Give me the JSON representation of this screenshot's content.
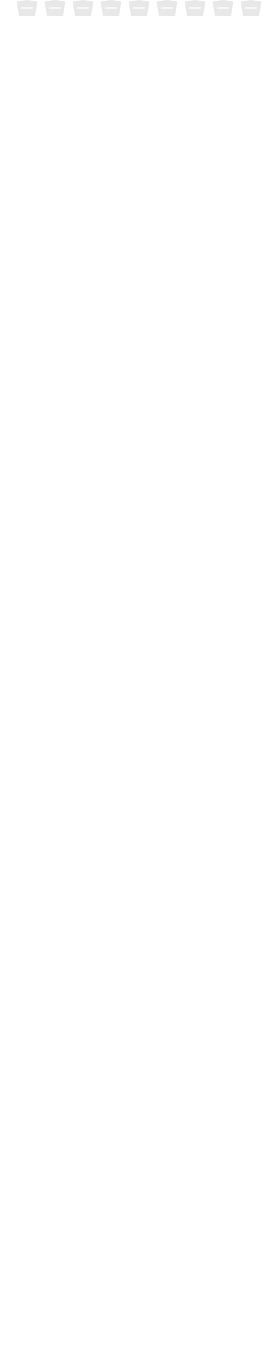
{
  "document": {
    "title": "Report Page Preview",
    "appearance": "faded-grayscale-scan",
    "page_width_px": 278,
    "page_height_px": 1347,
    "ink_color": "#e3e3e3",
    "background_color": "#ffffff",
    "rule_color": "#ededed"
  },
  "sections": [
    {
      "type": "icon-row",
      "label": "icon row (clipped)"
    },
    {
      "type": "text-block",
      "label": "paragraph block"
    },
    {
      "type": "wheel",
      "label": "radial wheel diagram"
    },
    {
      "type": "bars",
      "label": "chevron bar groups"
    },
    {
      "type": "icon-row",
      "label": "icon row"
    },
    {
      "type": "text-block",
      "label": "paragraph block"
    },
    {
      "type": "wheel",
      "label": "radial wheel diagram"
    },
    {
      "type": "bars",
      "label": "chevron bar groups"
    },
    {
      "type": "icon-row",
      "label": "icon row"
    },
    {
      "type": "text-block",
      "label": "paragraph block"
    },
    {
      "type": "wheel",
      "label": "radial wheel diagram"
    },
    {
      "type": "bars",
      "label": "chevron bar groups"
    },
    {
      "type": "icon-row",
      "label": "icon row"
    },
    {
      "type": "text-block",
      "label": "paragraph block"
    },
    {
      "type": "wheel",
      "label": "radial wheel diagram (clipped)"
    }
  ],
  "wheel": {
    "name": "radial-wheel-diagram",
    "slice_count": 12,
    "diameter_px": 200,
    "slice_color": "#e0e0e0",
    "gap_color": "#ffffff",
    "corner_annotations": [
      {
        "position": "top-left",
        "marker": "triangle-up"
      },
      {
        "position": "top-right",
        "marker": "triangle-up"
      },
      {
        "position": "bottom-left",
        "marker": "triangle-down"
      },
      {
        "position": "bottom-right",
        "marker": "triangle-down"
      }
    ]
  },
  "bars": {
    "name": "chevron-bar-groups",
    "group_count": 4,
    "rows_per_group": 5,
    "chevron_color": "#e5e5e5"
  },
  "icons": {
    "name": "pentagon-icon-row",
    "count": 9,
    "shape": "pentagon",
    "fill": "#e8e8e8",
    "inner_lines": 3
  },
  "text": {
    "name": "paragraph-lines",
    "lines_per_block": 4,
    "line_color": "#ebebeb",
    "segments": [
      [
        52,
        44,
        38,
        50,
        30,
        42,
        36
      ],
      [
        46,
        40,
        52,
        34,
        48,
        30,
        40
      ],
      [
        38,
        50,
        42,
        46,
        36,
        52,
        28
      ],
      [
        50,
        34,
        46,
        40,
        30,
        44,
        38
      ]
    ]
  },
  "chart_data": {
    "type": "pie",
    "title": "",
    "labels": [
      "S1",
      "S2",
      "S3",
      "S4",
      "S5",
      "S6",
      "S7",
      "S8",
      "S9",
      "S10",
      "S11",
      "S12"
    ],
    "values": [
      1,
      1,
      1,
      1,
      1,
      1,
      1,
      1,
      1,
      1,
      1,
      1
    ],
    "legend": "none",
    "grid": false
  }
}
